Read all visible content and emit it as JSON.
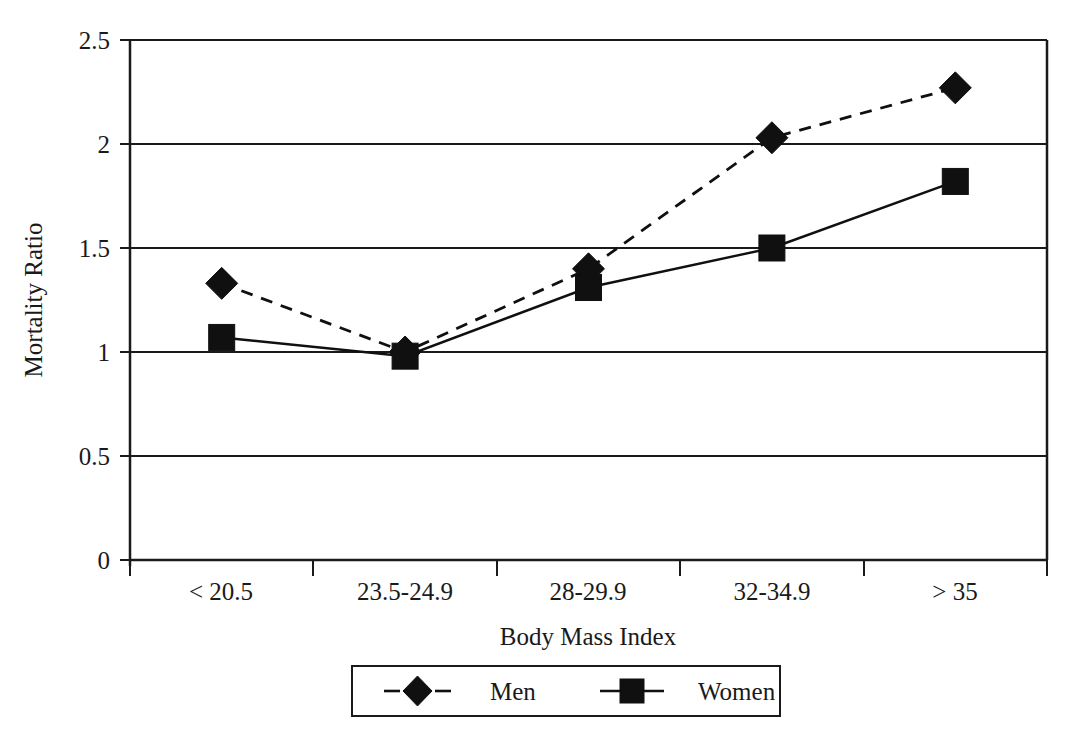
{
  "chart_data": {
    "type": "line",
    "title": "",
    "xlabel": "Body Mass Index",
    "ylabel": "Mortality Ratio",
    "categories": [
      "< 20.5",
      "23.5-24.9",
      "28-29.9",
      "32-34.9",
      "> 35"
    ],
    "series": [
      {
        "name": "Men",
        "marker": "diamond",
        "linestyle": "dashed",
        "color": "#101010",
        "values": [
          1.33,
          1.0,
          1.4,
          2.03,
          2.27
        ]
      },
      {
        "name": "Women",
        "marker": "square",
        "linestyle": "solid",
        "color": "#101010",
        "values": [
          1.07,
          0.98,
          1.31,
          1.5,
          1.82
        ]
      }
    ],
    "ylim": [
      0,
      2.5
    ],
    "yticks": [
      0,
      0.5,
      1,
      1.5,
      2,
      2.5
    ],
    "ytick_labels": [
      "0",
      "0.5",
      "1",
      "1.5",
      "2",
      "2.5"
    ],
    "grid": "horizontal",
    "legend_position": "bottom-center",
    "legend_entries": [
      "Men",
      "Women"
    ]
  },
  "axes": {
    "y_axis_label": "Mortality Ratio",
    "x_axis_label": "Body Mass Index",
    "y_tick_labels": [
      "2.5",
      "2",
      "1.5",
      "1",
      "0.5",
      "0"
    ],
    "x_tick_labels": [
      "< 20.5",
      "23.5-24.9",
      "28-29.9",
      "32-34.9",
      "> 35"
    ]
  },
  "legend": {
    "items": [
      {
        "label": "Men",
        "marker": "diamond-marker",
        "line": "dashed"
      },
      {
        "label": "Women",
        "marker": "square-marker",
        "line": "solid"
      }
    ]
  },
  "colors": {
    "ink": "#101010",
    "axis": "#1a1a1a",
    "background": "#ffffff"
  }
}
